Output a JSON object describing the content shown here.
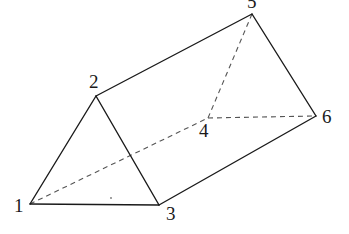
{
  "diagram": {
    "type": "triangular-prism",
    "vertices": [
      {
        "id": "1",
        "label": "1",
        "x": 30,
        "y": 204,
        "lx": 14,
        "ly": 212
      },
      {
        "id": "2",
        "label": "2",
        "x": 96,
        "y": 96,
        "lx": 89,
        "ly": 88
      },
      {
        "id": "3",
        "label": "3",
        "x": 159,
        "y": 205,
        "lx": 166,
        "ly": 220
      },
      {
        "id": "4",
        "label": "4",
        "x": 208,
        "y": 118,
        "lx": 199,
        "ly": 137
      },
      {
        "id": "5",
        "label": "5",
        "x": 252,
        "y": 14,
        "lx": 247,
        "ly": 8
      },
      {
        "id": "6",
        "label": "6",
        "x": 316,
        "y": 116,
        "lx": 322,
        "ly": 123
      }
    ],
    "solid_edges": [
      [
        "1",
        "2"
      ],
      [
        "2",
        "3"
      ],
      [
        "1",
        "3"
      ],
      [
        "2",
        "5"
      ],
      [
        "5",
        "6"
      ],
      [
        "3",
        "6"
      ]
    ],
    "hidden_edges": [
      [
        "1",
        "4"
      ],
      [
        "4",
        "5"
      ],
      [
        "4",
        "6"
      ]
    ],
    "colors": {
      "line": "#1a1a1a",
      "hidden": "#555555",
      "background": "#ffffff"
    }
  }
}
